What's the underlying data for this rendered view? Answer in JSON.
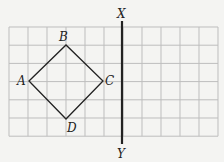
{
  "diagram": {
    "grid": {
      "cols": 11,
      "rows": 6,
      "left": 9,
      "top": 27,
      "cell_w": 19,
      "cell_h": 18.2,
      "color": "#bdbdbd"
    },
    "square": {
      "points": [
        {
          "label": "A",
          "x": 29,
          "y": 81
        },
        {
          "label": "B",
          "x": 66,
          "y": 45
        },
        {
          "label": "C",
          "x": 103,
          "y": 81
        },
        {
          "label": "D",
          "x": 66,
          "y": 119
        }
      ],
      "color": "#222222"
    },
    "mirror_line": {
      "x": 122,
      "y1": 21,
      "y2": 144,
      "top_label": "X",
      "bottom_label": "Y",
      "color": "#222222"
    }
  }
}
